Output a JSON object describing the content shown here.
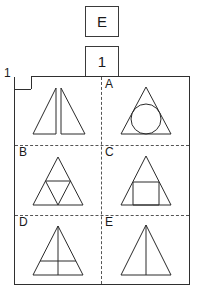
{
  "answer_boxes": [
    {
      "name": "letter-answer",
      "value": "E"
    },
    {
      "name": "number-answer",
      "value": "1"
    }
  ],
  "matrix": {
    "question_number": "1",
    "cells": [
      {
        "id": "question",
        "label": "",
        "figure": "two-mirrored-right-triangles",
        "description": "Two right triangles forming a mirrored pair, vertical edges facing each other"
      },
      {
        "id": "a",
        "label": "A",
        "figure": "triangle-with-inscribed-circle",
        "description": "Isosceles triangle containing an inscribed circle"
      },
      {
        "id": "b",
        "label": "B",
        "figure": "triangle-with-medial-triangle",
        "description": "Isosceles triangle subdivided into four smaller triangles by its midsegments"
      },
      {
        "id": "c",
        "label": "C",
        "figure": "triangle-with-inscribed-square",
        "description": "Isosceles triangle containing a square resting on the base"
      },
      {
        "id": "d",
        "label": "D",
        "figure": "triangle-with-altitude-and-midline",
        "description": "Isosceles triangle with a vertical altitude and a horizontal midline crossing it"
      },
      {
        "id": "e",
        "label": "E",
        "figure": "triangle-with-altitude",
        "description": "Isosceles triangle divided by a single vertical altitude"
      }
    ]
  },
  "colors": {
    "stroke": "#2a2a2a",
    "divider": "#555555",
    "panel_border": "#2f2f2f",
    "background": "#ffffff"
  }
}
